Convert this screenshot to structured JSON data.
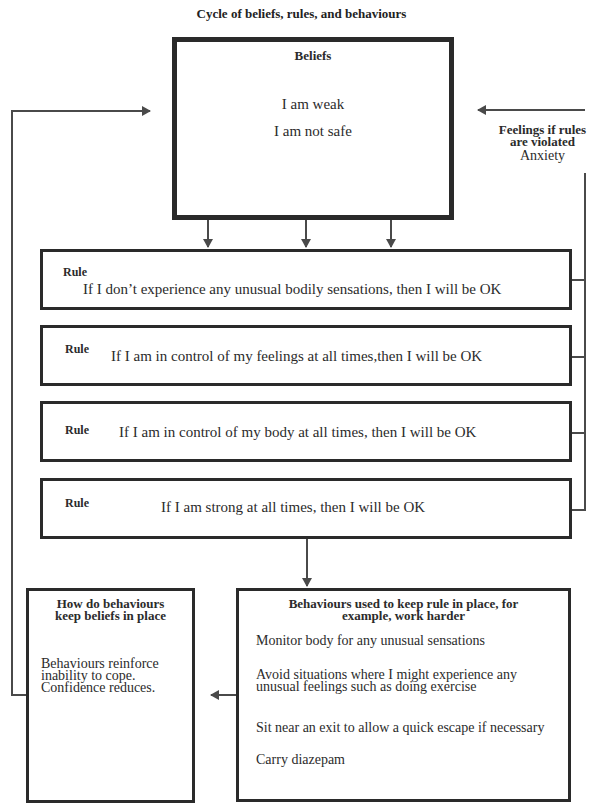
{
  "title": "Cycle of beliefs, rules, and behaviours",
  "beliefs": {
    "heading": "Beliefs",
    "items": [
      "I am weak",
      "I am not safe"
    ]
  },
  "feelings": {
    "heading_line1": "Feelings if rules",
    "heading_line2": "are violated",
    "value": "Anxiety"
  },
  "rules": [
    {
      "label": "Rule",
      "text": "If I don’t experience any unusual bodily sensations, then I will be OK"
    },
    {
      "label": "Rule",
      "text": "If I am in control of my feelings at all times,then I will be OK"
    },
    {
      "label": "Rule",
      "text": "If I am in control of my body at all times, then I will be OK"
    },
    {
      "label": "Rule",
      "text": "If I am strong at all times, then I will be OK"
    }
  ],
  "behaviours": {
    "heading_line1": "Behaviours used to keep rule in place, for",
    "heading_line2": "example, work harder",
    "items": [
      "Monitor body for any unusual sensations",
      "Avoid situations where I might experience any unusual feelings such as doing exercise",
      "Sit near an exit to allow a quick escape if necessary",
      "Carry diazepam"
    ]
  },
  "how": {
    "heading_line1": "How do behaviours",
    "heading_line2": "keep beliefs in place",
    "text": "Behaviours reinforce inability to cope. Confidence reduces."
  },
  "colors": {
    "line": "#4a4a4a",
    "box_border": "#2a2a2a",
    "text": "#2b2b2b"
  }
}
